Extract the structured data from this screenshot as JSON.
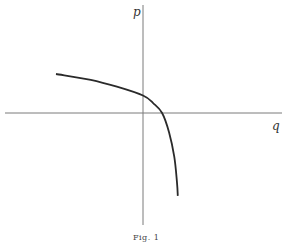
{
  "figure": {
    "caption": "Fig. 1",
    "x_axis_label": "q",
    "y_axis_label": "p"
  },
  "chart_data": {
    "type": "line",
    "title": "",
    "xlabel": "q",
    "ylabel": "p",
    "grid": false,
    "legend": "none",
    "xlim": [
      -1.0,
      1.4
    ],
    "ylim": [
      -1.0,
      1.0
    ],
    "series": [
      {
        "name": "curve",
        "x": [
          -1.0,
          -0.6,
          -0.3,
          0.0,
          0.12,
          0.22,
          0.3,
          0.36,
          0.39,
          0.4
        ],
        "y": [
          0.4,
          0.34,
          0.27,
          0.18,
          0.1,
          0.0,
          -0.2,
          -0.45,
          -0.7,
          -0.85
        ]
      }
    ]
  }
}
